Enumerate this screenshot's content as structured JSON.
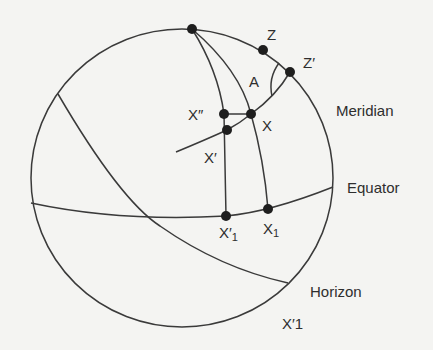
{
  "diagram": {
    "type": "celestial-sphere",
    "great_circles": [
      "Meridian",
      "Equator",
      "Horizon"
    ],
    "points": [
      {
        "id": "pole",
        "label": ""
      },
      {
        "id": "Z",
        "label": "Z"
      },
      {
        "id": "Z_prime",
        "label": "Z′"
      },
      {
        "id": "X",
        "label": "X"
      },
      {
        "id": "X_double_prime",
        "label": "X″"
      },
      {
        "id": "X_prime",
        "label": "X′"
      },
      {
        "id": "X1",
        "label": "X",
        "sub": "1"
      },
      {
        "id": "X_prime_1",
        "label": "X′",
        "sub": "1"
      }
    ],
    "angle_label": "A"
  },
  "labels": {
    "z": "Z",
    "z_prime": "Z′",
    "a": "A",
    "meridian": "Meridian",
    "x_double_prime": "X″",
    "x": "X",
    "x_prime": "X′",
    "equator": "Equator",
    "x_prime_1_main": "X′",
    "x_prime_1_sub": "1",
    "x1_main": "X",
    "x1_sub": "1",
    "horizon": "Horizon",
    "x_prime_1_bottom": "X′1"
  }
}
